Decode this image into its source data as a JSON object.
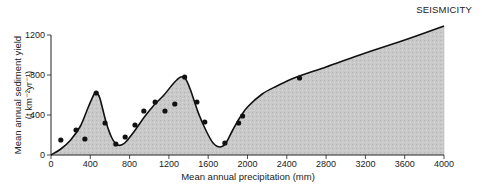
{
  "header": {
    "label": "SEISMICITY"
  },
  "chart_data": {
    "type": "line",
    "title": "",
    "xlabel": "Mean annual precipitation (mm)",
    "ylabel": "Mean annual sediment yield",
    "ylabel_units": "(t km⁻²yr⁻¹)",
    "xlim": [
      0,
      4000
    ],
    "ylim": [
      0,
      1200
    ],
    "x_ticks": [
      0,
      400,
      800,
      1200,
      1600,
      2000,
      2400,
      2800,
      3200,
      3600,
      4000
    ],
    "y_ticks": [
      0,
      400,
      800,
      1200
    ],
    "grid": false,
    "legend": null,
    "fill_under_curve": true,
    "fill_color": "#c8c8c8",
    "series": [
      {
        "name": "fitted curve",
        "kind": "line",
        "x": [
          0,
          100,
          200,
          300,
          380,
          440,
          470,
          500,
          560,
          620,
          680,
          750,
          850,
          950,
          1050,
          1150,
          1250,
          1320,
          1370,
          1420,
          1500,
          1580,
          1650,
          1720,
          1780,
          1850,
          1920,
          2000,
          2150,
          2300,
          2500,
          2800,
          3200,
          3600,
          4000
        ],
        "y": [
          0,
          60,
          150,
          290,
          480,
          610,
          620,
          560,
          330,
          170,
          100,
          120,
          240,
          380,
          500,
          600,
          720,
          780,
          760,
          650,
          420,
          240,
          120,
          80,
          120,
          250,
          370,
          480,
          610,
          690,
          780,
          880,
          1020,
          1150,
          1290
        ]
      },
      {
        "name": "observations",
        "kind": "scatter",
        "x": [
          100,
          255,
          345,
          460,
          550,
          660,
          755,
          855,
          945,
          1060,
          1160,
          1260,
          1360,
          1485,
          1565,
          1770,
          1910,
          1950,
          2530
        ],
        "y": [
          150,
          250,
          160,
          620,
          320,
          110,
          180,
          300,
          440,
          530,
          440,
          510,
          780,
          530,
          330,
          120,
          320,
          390,
          770
        ]
      }
    ]
  }
}
